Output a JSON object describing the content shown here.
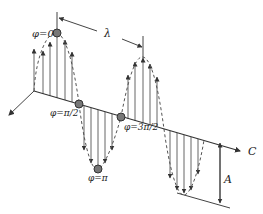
{
  "diagram": {
    "type": "transverse-wave-phase-diagram",
    "propagation_axis_label": "C",
    "wavelength_label": "λ",
    "amplitude_label": "A",
    "phase_points": [
      {
        "label": "φ=0",
        "x": 57,
        "y": 33
      },
      {
        "label": "φ=π/2",
        "x": 79,
        "y": 104
      },
      {
        "label": "φ=π",
        "x": 98,
        "y": 169
      },
      {
        "label": "φ=3π/2",
        "x": 121,
        "y": 117
      }
    ],
    "colors": {
      "line": "#444444",
      "dashed_curve": "#555555",
      "dot_fill": "#777777",
      "dot_stroke": "#333333"
    }
  }
}
